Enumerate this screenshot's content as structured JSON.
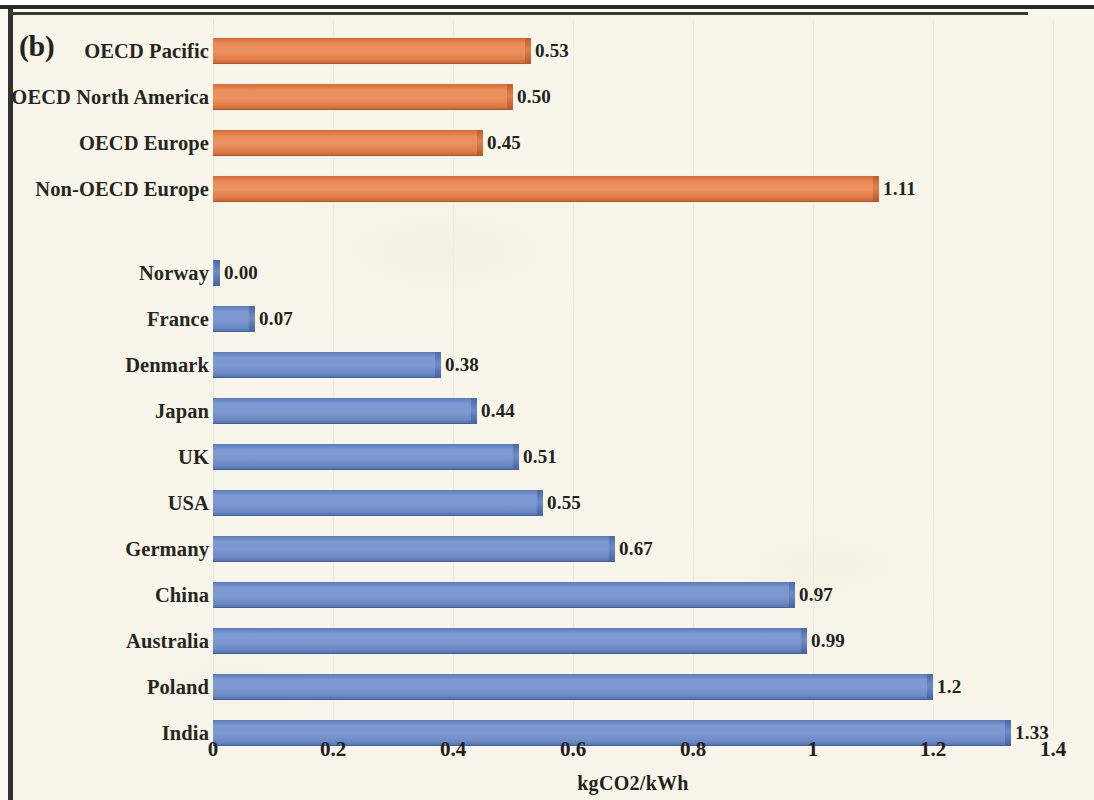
{
  "panel_tag": "(b)",
  "chart_data": {
    "type": "bar",
    "orientation": "horizontal",
    "title": "",
    "subtitle": "",
    "xlabel": "kgCO2/kWh",
    "ylabel": "",
    "xlim": [
      0,
      1.4
    ],
    "grid": true,
    "legend_position": "none",
    "x_ticks": [
      "0",
      "0.2",
      "0.4",
      "0.6",
      "0.8",
      "1",
      "1.2",
      "1.4"
    ],
    "x_tick_values": [
      0,
      0.2,
      0.4,
      0.6,
      0.8,
      1.0,
      1.2,
      1.4
    ],
    "colors": {
      "region_group": "#E07A4A",
      "country_group": "#6E8DC8",
      "background": "#F8F6EA",
      "text": "#22221C"
    },
    "groups": [
      {
        "name": "OECD regions",
        "color": "#E07A4A",
        "categories": [
          "OECD Pacific",
          "OECD North America",
          "OECD Europe",
          "Non-OECD Europe"
        ],
        "values": [
          0.53,
          0.5,
          0.45,
          1.11
        ],
        "labels": [
          "0.53",
          "0.50",
          "0.45",
          "1.11"
        ]
      },
      {
        "name": "Countries",
        "color": "#6E8DC8",
        "categories": [
          "Norway",
          "France",
          "Denmark",
          "Japan",
          "UK",
          "USA",
          "Germany",
          "China",
          "Australia",
          "Poland",
          "India"
        ],
        "values": [
          0.0,
          0.07,
          0.38,
          0.44,
          0.51,
          0.55,
          0.67,
          0.97,
          0.99,
          1.2,
          1.33
        ],
        "labels": [
          "0.00",
          "0.07",
          "0.38",
          "0.44",
          "0.51",
          "0.55",
          "0.67",
          "0.97",
          "0.99",
          "1.2",
          "1.33"
        ]
      }
    ],
    "categories": [
      "OECD Pacific",
      "OECD North America",
      "OECD Europe",
      "Non-OECD Europe",
      "Norway",
      "France",
      "Denmark",
      "Japan",
      "UK",
      "USA",
      "Germany",
      "China",
      "Australia",
      "Poland",
      "India"
    ],
    "values": [
      0.53,
      0.5,
      0.45,
      1.11,
      0.0,
      0.07,
      0.38,
      0.44,
      0.51,
      0.55,
      0.67,
      0.97,
      0.99,
      1.2,
      1.33
    ]
  }
}
